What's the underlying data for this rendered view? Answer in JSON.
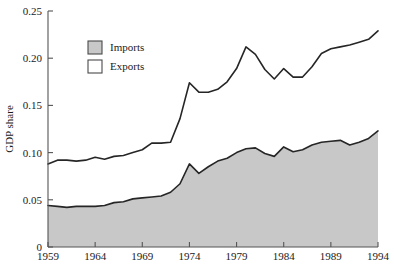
{
  "chart_data": {
    "type": "area",
    "subtype": "stacked-area",
    "title": "",
    "xlabel": "",
    "ylabel": "GDP share",
    "xlim": [
      1959,
      1994
    ],
    "ylim": [
      0,
      0.25
    ],
    "grid": false,
    "legend_position": "upper-left-inside",
    "xticks": [
      1959,
      1964,
      1969,
      1974,
      1979,
      1984,
      1989,
      1994
    ],
    "xtick_labels": [
      "1959",
      "1964",
      "1969",
      "1974",
      "1979",
      "1984",
      "1989",
      "1994"
    ],
    "yticks": [
      0,
      0.05,
      0.1,
      0.15,
      0.2,
      0.25
    ],
    "ytick_labels": [
      "0",
      "0.05",
      "0.10",
      "0.15",
      "0.20",
      "0.25"
    ],
    "x": [
      1959,
      1960,
      1961,
      1962,
      1963,
      1964,
      1965,
      1966,
      1967,
      1968,
      1969,
      1970,
      1971,
      1972,
      1973,
      1974,
      1975,
      1976,
      1977,
      1978,
      1979,
      1980,
      1981,
      1982,
      1983,
      1984,
      1985,
      1986,
      1987,
      1988,
      1989,
      1990,
      1991,
      1992,
      1993,
      1994
    ],
    "series": [
      {
        "name": "Imports",
        "color": "#c8c8c8",
        "values": [
          0.044,
          0.043,
          0.042,
          0.043,
          0.043,
          0.043,
          0.044,
          0.047,
          0.048,
          0.051,
          0.052,
          0.053,
          0.054,
          0.058,
          0.067,
          0.088,
          0.078,
          0.085,
          0.091,
          0.094,
          0.1,
          0.104,
          0.105,
          0.099,
          0.096,
          0.106,
          0.101,
          0.103,
          0.108,
          0.111,
          0.112,
          0.113,
          0.108,
          0.111,
          0.115,
          0.123
        ]
      },
      {
        "name": "Exports",
        "color": "#ffffff",
        "values": [
          0.044,
          0.049,
          0.05,
          0.048,
          0.049,
          0.052,
          0.049,
          0.049,
          0.049,
          0.049,
          0.051,
          0.057,
          0.056,
          0.053,
          0.069,
          0.086,
          0.086,
          0.079,
          0.076,
          0.081,
          0.089,
          0.108,
          0.099,
          0.089,
          0.082,
          0.083,
          0.079,
          0.077,
          0.083,
          0.094,
          0.098,
          0.099,
          0.106,
          0.106,
          0.105,
          0.106
        ]
      }
    ],
    "totals": [
      0.088,
      0.092,
      0.092,
      0.091,
      0.092,
      0.095,
      0.093,
      0.096,
      0.097,
      0.1,
      0.103,
      0.11,
      0.11,
      0.111,
      0.136,
      0.174,
      0.164,
      0.164,
      0.167,
      0.175,
      0.189,
      0.212,
      0.204,
      0.188,
      0.178,
      0.189,
      0.18,
      0.18,
      0.191,
      0.205,
      0.21,
      0.212,
      0.214,
      0.217,
      0.22,
      0.229
    ],
    "annotations": []
  },
  "legend": {
    "items": [
      {
        "label": "Imports",
        "swatch": "#c8c8c8"
      },
      {
        "label": "Exports",
        "swatch": "#ffffff"
      }
    ]
  },
  "caption": {
    "text": ""
  },
  "colors": {
    "background": "#ffffff",
    "line": "#262626",
    "axis": "#555555",
    "imports_fill": "#c8c8c8",
    "exports_fill": "#ffffff"
  }
}
